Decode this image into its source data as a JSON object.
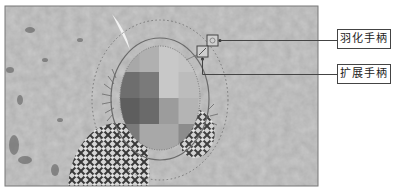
{
  "figure": {
    "callouts": [
      {
        "id": "feather",
        "label": "羽化手柄"
      },
      {
        "id": "expand",
        "label": "扩展手柄"
      }
    ],
    "mosaic": {
      "rows": 4,
      "cols": 4,
      "gray_levels": [
        [
          "#a8a8a8",
          "#b0b0b0",
          "#c8c8c8",
          "#c4c4c4"
        ],
        [
          "#6e6e6e",
          "#7a7a7a",
          "#c8c8c8",
          "#bcbcbc"
        ],
        [
          "#5e5e5e",
          "#6a6a6a",
          "#9c9c9c",
          "#b4b4b4"
        ],
        [
          "#7a7a7a",
          "#a8a8a8",
          "#a8a8a8",
          "#8c8c8c"
        ]
      ]
    },
    "colors": {
      "background": "#c9c9c9",
      "frame": "#777777",
      "line": "#444444",
      "ellipse": "#6a6a6a"
    }
  }
}
